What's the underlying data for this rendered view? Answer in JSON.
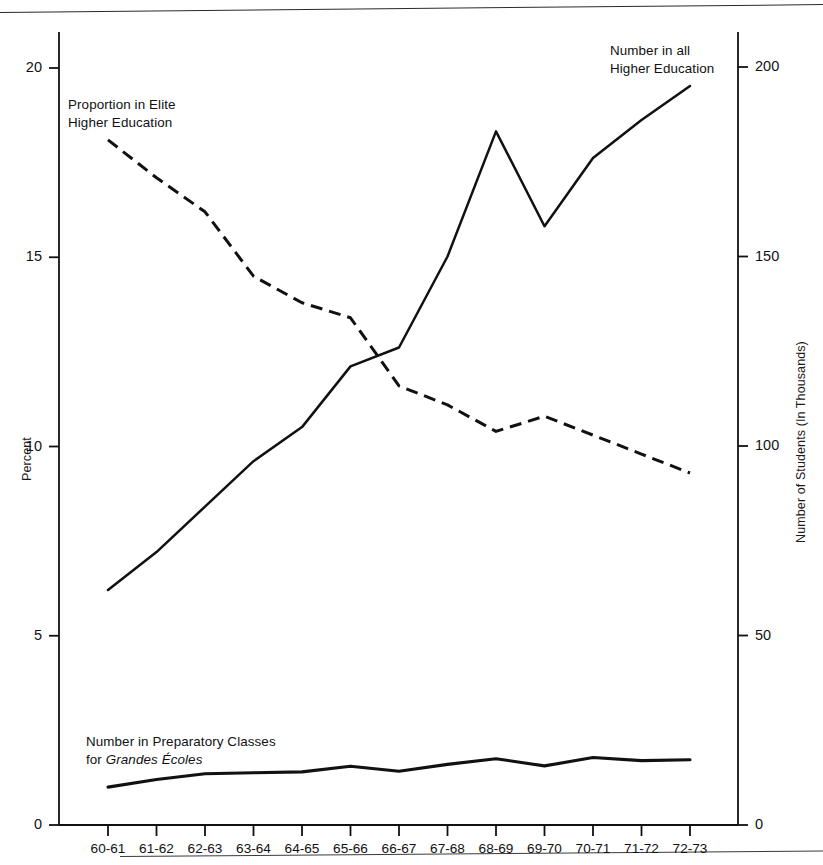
{
  "figure": {
    "background": "#ffffff",
    "line_color": "#111111"
  },
  "axes": {
    "left": {
      "title": "Percent",
      "ticks": [
        "0",
        "5",
        "10",
        "15",
        "20"
      ],
      "values": [
        0,
        5,
        10,
        15,
        20
      ]
    },
    "right": {
      "title": "Number of Students (In Thousands)",
      "ticks": [
        "0",
        "50",
        "100",
        "150",
        "200"
      ],
      "values": [
        0,
        50,
        100,
        150,
        200
      ]
    },
    "x": {
      "ticks": [
        "60-61",
        "61-62",
        "62-63",
        "63-64",
        "64-65",
        "65-66",
        "66-67",
        "67-68",
        "68-69",
        "69-70",
        "70-71",
        "71-72",
        "72-73"
      ]
    }
  },
  "annotations": {
    "elite": {
      "line1": "Proportion in Elite",
      "line2": "Higher Education"
    },
    "all_higher": {
      "line1": "Number in all",
      "line2": "Higher Education"
    },
    "prep": {
      "line1": "Number in Preparatory Classes",
      "line2_prefix": "for ",
      "line2_italic": "Grandes Écoles"
    }
  },
  "chart_data": {
    "type": "line",
    "title": "",
    "xlabel": "",
    "ylabel": "Percent",
    "y2label": "Number of Students (In Thousands)",
    "grid": false,
    "legend": "annotations-inline",
    "categories": [
      "60-61",
      "61-62",
      "62-63",
      "63-64",
      "64-65",
      "65-66",
      "66-67",
      "67-68",
      "68-69",
      "69-70",
      "70-71",
      "71-72",
      "72-73"
    ],
    "ylim": [
      0,
      21.0
    ],
    "y2lim": [
      0,
      210
    ],
    "series": [
      {
        "name": "Proportion in Elite Higher Education",
        "axis": "left",
        "unit": "percent",
        "style": "dashed",
        "values": [
          18.1,
          17.1,
          16.2,
          14.5,
          13.8,
          13.4,
          11.6,
          11.1,
          10.4,
          10.8,
          10.3,
          9.8,
          9.3
        ]
      },
      {
        "name": "Number in all Higher Education",
        "axis": "right",
        "unit": "thousands",
        "style": "solid",
        "values": [
          62,
          72,
          84,
          96,
          105,
          121,
          126,
          150,
          183,
          158,
          176,
          186,
          195
        ]
      },
      {
        "name": "Number in Preparatory Classes for Grandes Écoles",
        "axis": "right",
        "unit": "thousands",
        "style": "solid",
        "values": [
          10.0,
          12.0,
          13.5,
          13.8,
          14.0,
          15.5,
          14.2,
          16.0,
          17.5,
          15.6,
          17.8,
          17.0,
          17.2
        ]
      }
    ]
  }
}
